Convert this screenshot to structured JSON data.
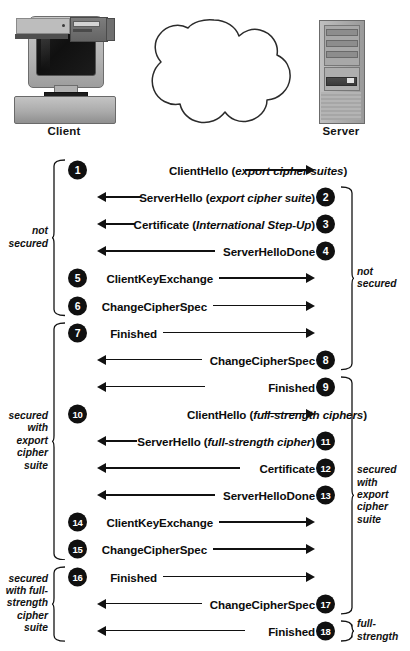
{
  "diagram": {
    "endpoints": {
      "client_label": "Client",
      "server_label": "Server",
      "network_icon": "cloud-icon",
      "client_icon": "desktop-computer-icon",
      "server_icon": "server-tower-icon"
    },
    "messages": [
      {
        "num": "1",
        "text": "ClientHello (",
        "italic": "export cipher suites",
        "suffix": ")",
        "direction": "client-to-server",
        "badge_side": "left",
        "arrow_len": 70
      },
      {
        "num": "2",
        "text": "ServerHello (",
        "italic": "export cipher suite",
        "suffix": ")",
        "direction": "server-to-client",
        "badge_side": "right",
        "arrow_len": 44
      },
      {
        "num": "3",
        "text": "Certificate (",
        "italic": "International Step-Up",
        "suffix": ")",
        "direction": "server-to-client",
        "badge_side": "right",
        "arrow_len": 38
      },
      {
        "num": "4",
        "text": "ServerHelloDone",
        "italic": "",
        "suffix": "",
        "direction": "server-to-client",
        "badge_side": "right",
        "arrow_len": 118
      },
      {
        "num": "5",
        "text": "ClientKeyExchange",
        "italic": "",
        "suffix": "",
        "direction": "client-to-server",
        "badge_side": "left",
        "arrow_len": 96
      },
      {
        "num": "6",
        "text": "ChangeCipherSpec",
        "italic": "",
        "suffix": "",
        "direction": "client-to-server",
        "badge_side": "left",
        "arrow_len": 102
      },
      {
        "num": "7",
        "text": "Finished",
        "italic": "",
        "suffix": "",
        "direction": "client-to-server",
        "badge_side": "left",
        "arrow_len": 152
      },
      {
        "num": "8",
        "text": "ChangeCipherSpec",
        "italic": "",
        "suffix": "",
        "direction": "server-to-client",
        "badge_side": "right",
        "arrow_len": 105
      },
      {
        "num": "9",
        "text": "Finished",
        "italic": "",
        "suffix": "",
        "direction": "server-to-client",
        "badge_side": "right",
        "arrow_len": 108
      },
      {
        "num": "10",
        "text": "ClientHello (",
        "italic": "full-strength ciphers",
        "suffix": ")",
        "direction": "client-to-server",
        "badge_side": "left",
        "arrow_len": 52
      },
      {
        "num": "11",
        "text": "ServerHello (",
        "italic": "full-strength cipher",
        "suffix": ")",
        "direction": "server-to-client",
        "badge_side": "right",
        "arrow_len": 40
      },
      {
        "num": "12",
        "text": "Certificate",
        "italic": "",
        "suffix": "",
        "direction": "server-to-client",
        "badge_side": "right",
        "arrow_len": 143
      },
      {
        "num": "13",
        "text": "ServerHelloDone",
        "italic": "",
        "suffix": "",
        "direction": "server-to-client",
        "badge_side": "right",
        "arrow_len": 118
      },
      {
        "num": "14",
        "text": "ClientKeyExchange",
        "italic": "",
        "suffix": "",
        "direction": "client-to-server",
        "badge_side": "left",
        "arrow_len": 96
      },
      {
        "num": "15",
        "text": "ChangeCipherSpec",
        "italic": "",
        "suffix": "",
        "direction": "client-to-server",
        "badge_side": "left",
        "arrow_len": 102
      },
      {
        "num": "16",
        "text": "Finished",
        "italic": "",
        "suffix": "",
        "direction": "client-to-server",
        "badge_side": "left",
        "arrow_len": 152
      },
      {
        "num": "17",
        "text": "ChangeCipherSpec",
        "italic": "",
        "suffix": "",
        "direction": "server-to-client",
        "badge_side": "right",
        "arrow_len": 105
      },
      {
        "num": "18",
        "text": "Finished",
        "italic": "",
        "suffix": "",
        "direction": "server-to-client",
        "badge_side": "right",
        "arrow_len": 148
      }
    ],
    "annotations": {
      "left": [
        {
          "label": "not\nsecured",
          "from_msg": "1",
          "to_msg": "6"
        },
        {
          "label": "secured\nwith\nexport\ncipher\nsuite",
          "from_msg": "7",
          "to_msg": "15"
        },
        {
          "label": "secured\nwith full-\nstrength\ncipher\nsuite",
          "from_msg": "16",
          "to_msg": "18"
        }
      ],
      "right": [
        {
          "label": "not\nsecured",
          "from_msg": "2",
          "to_msg": "8"
        },
        {
          "label": "secured\nwith\nexport\ncipher\nsuite",
          "from_msg": "9",
          "to_msg": "17"
        },
        {
          "label": "full-\nstrength",
          "from_msg": "18",
          "to_msg": "18"
        }
      ]
    },
    "colors": {
      "badge_fill": "#101010",
      "badge_text": "#ffffff",
      "line": "#111111",
      "text": "#0c0c0c",
      "background": "#ffffff"
    }
  }
}
